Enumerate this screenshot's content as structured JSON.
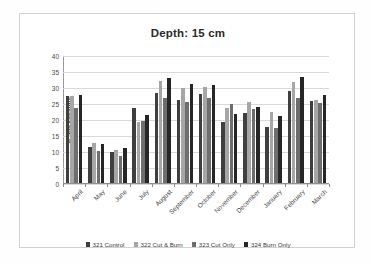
{
  "chart_data": {
    "type": "bar",
    "title": "Depth: 15 cm",
    "xlabel": "",
    "ylabel": "% Soil Moisture",
    "ylim": [
      0,
      40
    ],
    "ytick_step": 5,
    "yticks": [
      0,
      5,
      10,
      15,
      20,
      25,
      30,
      35,
      40
    ],
    "grid": true,
    "legend_position": "bottom",
    "categories": [
      "April",
      "May",
      "June",
      "July",
      "August",
      "September",
      "October",
      "November",
      "December",
      "January",
      "February",
      "March"
    ],
    "series": [
      {
        "name": "321 Control",
        "color": "#3f3f3f",
        "values": [
          27.1,
          11.4,
          9.8,
          23.4,
          28.2,
          25.8,
          27.8,
          19.0,
          22.0,
          17.5,
          28.9,
          25.5
        ]
      },
      {
        "name": "322 Cut & Burn",
        "color": "#a6a6a6",
        "values": [
          27.1,
          12.6,
          10.4,
          19.1,
          31.8,
          29.8,
          30.1,
          23.3,
          25.3,
          22.2,
          31.7,
          25.9
        ]
      },
      {
        "name": "323 Cut Only",
        "color": "#6e6e6e",
        "values": [
          23.4,
          10.0,
          8.3,
          19.3,
          26.5,
          25.2,
          26.7,
          24.6,
          23.0,
          17.2,
          26.5,
          24.9
        ]
      },
      {
        "name": "324 Burn Only",
        "color": "#262626",
        "values": [
          27.5,
          12.3,
          10.9,
          21.3,
          32.7,
          31.0,
          30.5,
          21.5,
          23.6,
          20.9,
          33.2,
          27.6
        ]
      }
    ]
  }
}
